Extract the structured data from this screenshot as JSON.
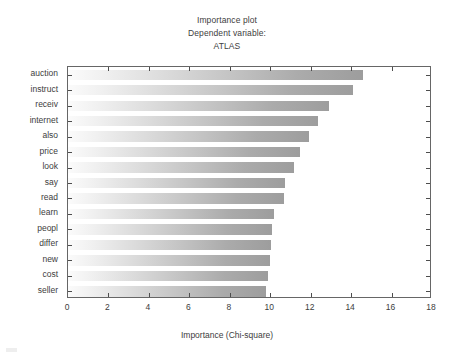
{
  "chart_data": {
    "type": "bar",
    "orientation": "horizontal",
    "title": "Importance plot",
    "subtitle": "Dependent variable:",
    "subtitle2": "ATLAS",
    "xlabel": "Importance (Chi-square)",
    "ylabel": "",
    "xlim": [
      0,
      18
    ],
    "xticks": [
      0,
      2,
      4,
      6,
      8,
      10,
      12,
      14,
      16,
      18
    ],
    "xtick_labels": [
      "0",
      "2",
      "4",
      "6",
      "8",
      "10",
      "12",
      "14",
      "16",
      "18"
    ],
    "grid": false,
    "legend": null,
    "categories": [
      "auction",
      "instruct",
      "receiv",
      "internet",
      "also",
      "price",
      "look",
      "say",
      "read",
      "learn",
      "peopl",
      "differ",
      "new",
      "cost",
      "seller"
    ],
    "values": [
      14.6,
      14.1,
      12.9,
      12.35,
      11.9,
      11.45,
      11.2,
      10.75,
      10.7,
      10.2,
      10.1,
      10.05,
      10.0,
      9.9,
      9.8
    ],
    "bar_color_start": "#fbfbfb",
    "bar_color_end": "#9d9d9d",
    "axis_color": "#666666"
  },
  "header": {
    "title": "Importance plot",
    "line2": "Dependent variable:",
    "line3": "ATLAS"
  },
  "footer": {
    "axis_title": "Importance (Chi-square)"
  }
}
